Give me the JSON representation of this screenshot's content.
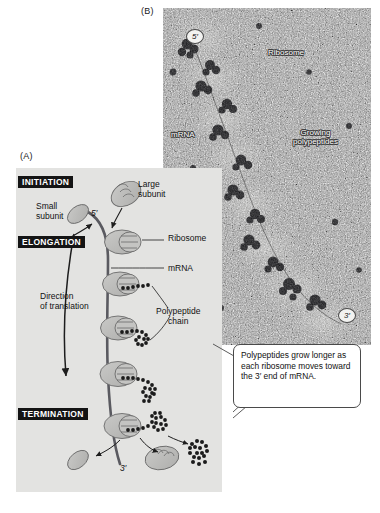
{
  "figure": {
    "title_internal": "Translation of mRNA by ribosomes (polysome)",
    "panel_a_letter": "(A)",
    "panel_b_letter": "(B)"
  },
  "panel_a": {
    "stages": [
      {
        "id": "initiation",
        "label": "INITIATION"
      },
      {
        "id": "elongation",
        "label": "ELONGATION"
      },
      {
        "id": "termination",
        "label": "TERMINATION"
      }
    ],
    "labels": {
      "small_subunit": "Small\nsubunit",
      "large_subunit": "Large\nsubunit",
      "ribosome": "Ribosome",
      "mrna": "mRNA",
      "direction": "Direction\nof translation",
      "polypeptide_chain": "Polypeptide\nchain"
    },
    "ends": {
      "five_prime": "5′",
      "three_prime": "3′"
    },
    "colors": {
      "panel_background": "#e3e3e1",
      "ribosome_fill": "#b9b9b7",
      "subunit_fill": "#bdbdbb",
      "stage_box": "#141414",
      "stage_text": "#ffffff",
      "mrna_strand": "#55555a",
      "polypeptide_bead": "#1b1b1b"
    },
    "ribosome_count_on_mrna": 5
  },
  "panel_b": {
    "labels": {
      "ribosome": "Ribosome",
      "mrna": "mRNA",
      "growing_polypeptides": "Growing\npolypeptides"
    },
    "ends": {
      "five_prime": "5′",
      "three_prime": "3′"
    },
    "colors": {
      "micrograph_mid": "#8d8d8d",
      "label_text": "#ffffff",
      "label_outline": "#3a3a3a"
    }
  },
  "callout": {
    "text": "Polypeptides grow longer as each ribosome moves toward the 3′ end of mRNA.",
    "border_color": "#4a4a4a",
    "background": "#ffffff"
  }
}
